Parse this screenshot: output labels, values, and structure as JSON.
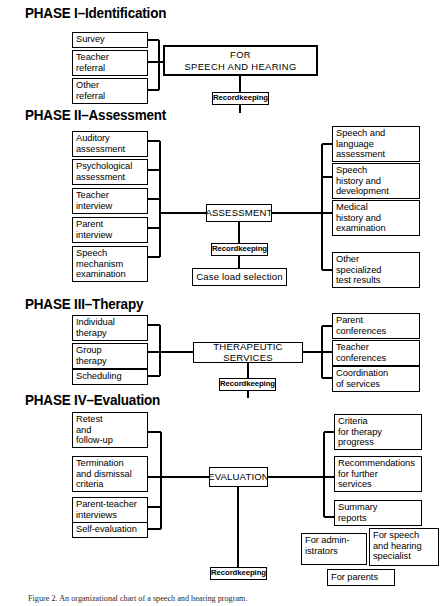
{
  "figure": {
    "caption": "Figure 2. An organizational chart of a speech and hearing program."
  },
  "phases": [
    {
      "id": "phase-1",
      "label": "PHASE I–Identification"
    },
    {
      "id": "phase-2",
      "label": "PHASE II–Assessment"
    },
    {
      "id": "phase-3",
      "label": "PHASE III–Therapy"
    },
    {
      "id": "phase-4",
      "label": "PHASE IV–Evaluation"
    }
  ],
  "boxes": {
    "p1_survey": "Survey",
    "p1_teacher_referral": "Teacher\nreferral",
    "p1_other_referral": "Other\nreferral",
    "p1_main": "IDENTIFICATION OF CHILDREN FOR\nSPEECH AND HEARING PROGRAM",
    "p1_recordkeeping": "Recordkeeping",
    "p2_auditory": "Auditory\nassessment",
    "p2_psychological": "Psychological\nassessment",
    "p2_teacher_interview": "Teacher\ninterview",
    "p2_parent_interview": "Parent\ninterview",
    "p2_speech_mechanism": "Speech\nmechanism\nexamination",
    "p2_main": "ASSESSMENT",
    "p2_recordkeeping": "Recordkeeping",
    "p2_caseload": "Case load selection",
    "p2_speech_language": "Speech and\nlanguage\nassessment",
    "p2_speech_history": "Speech\nhistory and\ndevelopment",
    "p2_medical_history": "Medical\nhistory and\nexamination",
    "p2_other_tests": "Other\nspecialized\ntest results",
    "p3_individual": "Individual\ntherapy",
    "p3_group": "Group\ntherapy",
    "p3_scheduling": "Scheduling",
    "p3_main": "THERAPEUTIC SERVICES",
    "p3_recordkeeping": "Recordkeeping",
    "p3_parent_conf": "Parent\nconferences",
    "p3_teacher_conf": "Teacher\nconferences",
    "p3_coordination": "Coordination\nof services",
    "p4_retest": "Retest\nand\nfollow-up",
    "p4_termination": "Termination\nand dismissal\ncriteria",
    "p4_parent_teacher": "Parent-teacher\ninterviews",
    "p4_self_evaluation": "Self-evaluation",
    "p4_main": "EVALUATION",
    "p4_recordkeeping": "Recordkeeping",
    "p4_criteria": "Criteria\nfor therapy\nprogress",
    "p4_recommendations": "Recommendations\nfor further\nservices",
    "p4_summary": "Summary\nreports",
    "p4_for_admin": "For admin-\nistrators",
    "p4_for_specialist": "For speech\nand hearing\nspecialist",
    "p4_for_parents": "For parents"
  },
  "colors": {
    "line": "#000000",
    "background": "#ffffff",
    "text": "#000000"
  }
}
